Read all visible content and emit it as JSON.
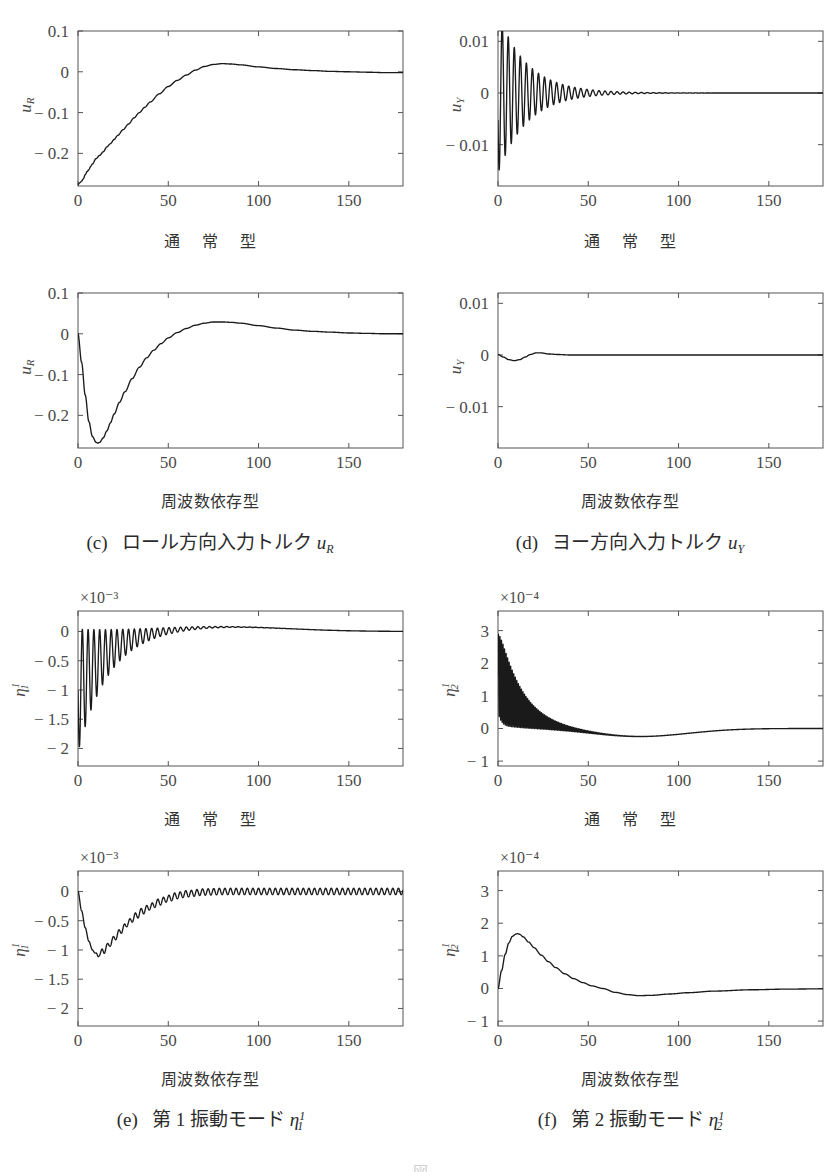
{
  "figure": {
    "bottom_caption": "図",
    "background": "#ffffff",
    "curve_color": "#1a1a1a",
    "axis_color": "#555555"
  },
  "panels": [
    {
      "id": "panel-c-top",
      "row_label": "通 常 型",
      "ylabel_main": "u",
      "ylabel_sub": "R",
      "ylabel_sup": "",
      "xlabel": "t",
      "multiplier": "",
      "yticks": [
        "0.1",
        "0",
        "-0.1",
        "-0.2"
      ],
      "ytick_values": [
        0.1,
        0,
        -0.1,
        -0.2
      ],
      "xticks": [
        "0",
        "50",
        "100",
        "150"
      ],
      "xtick_values": [
        0,
        50,
        100,
        150
      ]
    },
    {
      "id": "panel-d-top",
      "row_label": "通 常 型",
      "ylabel_main": "u",
      "ylabel_sub": "Y",
      "ylabel_sup": "",
      "xlabel": "t",
      "multiplier": "",
      "yticks": [
        "0.01",
        "0",
        "-0.01"
      ],
      "ytick_values": [
        0.01,
        0,
        -0.01
      ],
      "xticks": [
        "0",
        "50",
        "100",
        "150"
      ],
      "xtick_values": [
        0,
        50,
        100,
        150
      ]
    },
    {
      "id": "panel-c-bottom",
      "row_label": "周波数依存型",
      "ylabel_main": "u",
      "ylabel_sub": "R",
      "ylabel_sup": "",
      "xlabel": "t",
      "multiplier": "",
      "yticks": [
        "0.1",
        "0",
        "-0.1",
        "-0.2"
      ],
      "ytick_values": [
        0.1,
        0,
        -0.1,
        -0.2
      ],
      "xticks": [
        "0",
        "50",
        "100",
        "150"
      ],
      "xtick_values": [
        0,
        50,
        100,
        150
      ]
    },
    {
      "id": "panel-d-bottom",
      "row_label": "周波数依存型",
      "ylabel_main": "u",
      "ylabel_sub": "Y",
      "ylabel_sup": "",
      "xlabel": "t",
      "multiplier": "",
      "yticks": [
        "0.01",
        "0",
        "-0.01"
      ],
      "ytick_values": [
        0.01,
        0,
        -0.01
      ],
      "xticks": [
        "0",
        "50",
        "100",
        "150"
      ],
      "xtick_values": [
        0,
        50,
        100,
        150
      ]
    },
    {
      "id": "panel-e-top",
      "row_label": "通 常 型",
      "ylabel_main": "η",
      "ylabel_sub": "1",
      "ylabel_sup": "1",
      "xlabel": "t",
      "multiplier": "×10⁻³",
      "yticks": [
        "0",
        "-0.5",
        "-1",
        "-1.5",
        "-2"
      ],
      "ytick_values": [
        0,
        -0.5,
        -1,
        -1.5,
        -2
      ],
      "xticks": [
        "0",
        "50",
        "100",
        "150"
      ],
      "xtick_values": [
        0,
        50,
        100,
        150
      ]
    },
    {
      "id": "panel-f-top",
      "row_label": "通 常 型",
      "ylabel_main": "η",
      "ylabel_sub": "2",
      "ylabel_sup": "1",
      "xlabel": "t",
      "multiplier": "×10⁻⁴",
      "yticks": [
        "3",
        "2",
        "1",
        "0",
        "-1"
      ],
      "ytick_values": [
        3,
        2,
        1,
        0,
        -1
      ],
      "xticks": [
        "0",
        "50",
        "100",
        "150"
      ],
      "xtick_values": [
        0,
        50,
        100,
        150
      ]
    },
    {
      "id": "panel-e-bottom",
      "row_label": "周波数依存型",
      "ylabel_main": "η",
      "ylabel_sub": "1",
      "ylabel_sup": "1",
      "xlabel": "t",
      "multiplier": "×10⁻³",
      "yticks": [
        "0",
        "-0.5",
        "-1",
        "-1.5",
        "-2"
      ],
      "ytick_values": [
        0,
        -0.5,
        -1,
        -1.5,
        -2
      ],
      "xticks": [
        "0",
        "50",
        "100",
        "150"
      ],
      "xtick_values": [
        0,
        50,
        100,
        150
      ]
    },
    {
      "id": "panel-f-bottom",
      "row_label": "周波数依存型",
      "ylabel_main": "η",
      "ylabel_sub": "2",
      "ylabel_sup": "1",
      "xlabel": "t",
      "multiplier": "×10⁻⁴",
      "yticks": [
        "3",
        "2",
        "1",
        "0",
        "-1"
      ],
      "ytick_values": [
        3,
        2,
        1,
        0,
        -1
      ],
      "xticks": [
        "0",
        "50",
        "100",
        "150"
      ],
      "xtick_values": [
        0,
        50,
        100,
        150
      ]
    }
  ],
  "captions": [
    {
      "id": "caption-c",
      "tag": "(c)",
      "text": "ロール方向入力トルク",
      "sym": "u",
      "sub": "R",
      "sup": ""
    },
    {
      "id": "caption-d",
      "tag": "(d)",
      "text": "ヨー方向入力トルク",
      "sym": "u",
      "sub": "Y",
      "sup": ""
    },
    {
      "id": "caption-e",
      "tag": "(e)",
      "text": "第 1 振動モード",
      "sym": "η",
      "sub": "1",
      "sup": "1"
    },
    {
      "id": "caption-f",
      "tag": "(f)",
      "text": "第 2 振動モード",
      "sym": "η",
      "sub": "2",
      "sup": "1"
    }
  ],
  "chart_data": [
    {
      "id": "panel-c-top",
      "type": "line",
      "title": "ロール方向入力トルク u_R — 通常型",
      "xlabel": "t",
      "ylabel": "u_R",
      "xlim": [
        0,
        180
      ],
      "ylim": [
        -0.28,
        0.1
      ],
      "grid": false,
      "legend": null,
      "multiplier": 1,
      "notes": "rises from -0.275 at t=0 with small ripples, overshoot peak +0.02 near t=77, settles to 0",
      "x": [
        0,
        1,
        2,
        3,
        4,
        5,
        6,
        7,
        8,
        10,
        12,
        14,
        16,
        18,
        20,
        22,
        25,
        28,
        31,
        34,
        37,
        40,
        45,
        50,
        55,
        60,
        65,
        70,
        75,
        80,
        85,
        90,
        100,
        110,
        120,
        130,
        140,
        150,
        160,
        170,
        180
      ],
      "y": [
        -0.276,
        -0.272,
        -0.268,
        -0.262,
        -0.252,
        -0.245,
        -0.24,
        -0.232,
        -0.226,
        -0.213,
        -0.205,
        -0.196,
        -0.184,
        -0.176,
        -0.166,
        -0.156,
        -0.142,
        -0.128,
        -0.113,
        -0.1,
        -0.087,
        -0.074,
        -0.054,
        -0.036,
        -0.021,
        -0.008,
        0.004,
        0.013,
        0.018,
        0.02,
        0.019,
        0.017,
        0.012,
        0.008,
        0.005,
        0.003,
        0.001,
        0.0,
        -0.001,
        -0.002,
        -0.002
      ]
    },
    {
      "id": "panel-d-top",
      "type": "line",
      "title": "ヨー方向入力トルク u_Y — 通常型",
      "xlabel": "t",
      "ylabel": "u_Y",
      "xlim": [
        0,
        180
      ],
      "ylim": [
        -0.018,
        0.012
      ],
      "grid": false,
      "legend": null,
      "multiplier": 1,
      "notes": "damped oscillation, initial spike to -0.017 at t~0.5, first positive peak +0.0105 at t~3, envelope decays to ~0 by t=90, period ~3.3",
      "envelope": {
        "t0": 0,
        "A0": 0.0155,
        "decay_tau": 16,
        "period": 3.35,
        "phase_deg": 200
      }
    },
    {
      "id": "panel-c-bottom",
      "type": "line",
      "title": "ロール方向入力トルク u_R — 周波数依存型",
      "xlabel": "t",
      "ylabel": "u_R",
      "xlim": [
        0,
        180
      ],
      "ylim": [
        -0.28,
        0.1
      ],
      "grid": false,
      "legend": null,
      "multiplier": 1,
      "notes": "smooth: starts 0, dips to -0.268 at t=11, rises, peak +0.029 at t=78, settles to ~0",
      "x": [
        0,
        2,
        4,
        6,
        8,
        10,
        11,
        12,
        14,
        16,
        18,
        20,
        23,
        26,
        30,
        34,
        38,
        42,
        46,
        50,
        55,
        60,
        65,
        70,
        75,
        80,
        85,
        90,
        100,
        110,
        120,
        130,
        140,
        150,
        160,
        170,
        180
      ],
      "y": [
        0.0,
        -0.07,
        -0.15,
        -0.215,
        -0.252,
        -0.266,
        -0.268,
        -0.266,
        -0.255,
        -0.238,
        -0.218,
        -0.197,
        -0.168,
        -0.142,
        -0.11,
        -0.082,
        -0.059,
        -0.04,
        -0.024,
        -0.01,
        0.003,
        0.013,
        0.021,
        0.026,
        0.029,
        0.029,
        0.028,
        0.026,
        0.02,
        0.014,
        0.009,
        0.006,
        0.004,
        0.002,
        0.001,
        0.0,
        0.0
      ]
    },
    {
      "id": "panel-d-bottom",
      "type": "line",
      "title": "ヨー方向入力トルク u_Y — 周波数依存型",
      "xlabel": "t",
      "ylabel": "u_Y",
      "xlim": [
        0,
        180
      ],
      "ylim": [
        -0.018,
        0.012
      ],
      "grid": false,
      "legend": null,
      "multiplier": 1,
      "notes": "nearly flat at 0; small dip to -0.0011 at t~9, small bump +0.0004 at t~22, then flat",
      "x": [
        0,
        3,
        6,
        9,
        12,
        15,
        18,
        21,
        24,
        28,
        33,
        40,
        50,
        60,
        80,
        100,
        120,
        150,
        180
      ],
      "y": [
        0.0001,
        -0.0004,
        -0.0009,
        -0.0011,
        -0.0009,
        -0.0004,
        0.0001,
        0.0004,
        0.0004,
        0.0002,
        0.0001,
        0.0,
        0.0,
        0.0,
        0.0,
        0.0,
        0.0,
        0.0,
        0.0
      ]
    },
    {
      "id": "panel-e-top",
      "type": "line",
      "title": "第1振動モード η₁¹ — 通常型 (×10⁻³)",
      "xlabel": "t",
      "ylabel": "η_1^1",
      "xlim": [
        0,
        180
      ],
      "ylim": [
        -2.3,
        0.35
      ],
      "grid": false,
      "legend": null,
      "multiplier": 0.001,
      "notes": "oscillation between 0 and -2.05 early (t~2), envelope decays to 0 by t~70, slight positive bulge +0.08 near t=75",
      "envelope": {
        "t0": 0,
        "A0": 1.05,
        "offset0": -1.02,
        "decay_tau": 17,
        "period": 3.2,
        "final": 0.0
      }
    },
    {
      "id": "panel-f-top",
      "type": "line",
      "title": "第2振動モード η₂¹ — 通常型 (×10⁻⁴)",
      "xlabel": "t",
      "ylabel": "η_2^1",
      "xlim": [
        0,
        180
      ],
      "ylim": [
        -1.15,
        3.6
      ],
      "grid": false,
      "legend": null,
      "multiplier": 0.0001,
      "notes": "dense high-frequency oscillation, max ~3.2 at t~1, envelope around a mean that decays from 1.7 to 0; dips to -0.25 near t=78 then returns to 0",
      "envelope": {
        "t0": 0,
        "A0": 1.6,
        "mean0": 1.7,
        "decay_tau": 13,
        "period": 0.85,
        "undershoot": -0.25,
        "undershoot_t": 78
      }
    },
    {
      "id": "panel-e-bottom",
      "type": "line",
      "title": "第1振動モード η₁¹ — 周波数依存型 (×10⁻³)",
      "xlabel": "t",
      "ylabel": "η_1^1",
      "xlim": [
        0,
        180
      ],
      "ylim": [
        -2.3,
        0.35
      ],
      "grid": false,
      "legend": null,
      "multiplier": 0.001,
      "notes": "starts 0, dips to -1.1 at t~11, rises back with small ripples amplitude ~0.05 persisting to t=180, settles near 0",
      "x": [
        0,
        2,
        4,
        6,
        8,
        10,
        11,
        12,
        14,
        16,
        18,
        21,
        24,
        28,
        32,
        36,
        40,
        45,
        50,
        55,
        60,
        70,
        80,
        100,
        120,
        150,
        180
      ],
      "y": [
        0.0,
        -0.33,
        -0.62,
        -0.85,
        -1.0,
        -1.07,
        -1.1,
        -1.06,
        -1.02,
        -0.95,
        -0.88,
        -0.77,
        -0.66,
        -0.53,
        -0.42,
        -0.33,
        -0.26,
        -0.18,
        -0.12,
        -0.07,
        -0.04,
        -0.01,
        0.0,
        0.0,
        0.0,
        0.0,
        0.0
      ],
      "ripple": {
        "amp": 0.055,
        "period": 3.1,
        "start_t": 8
      }
    },
    {
      "id": "panel-f-bottom",
      "type": "line",
      "title": "第2振動モード η₂¹ — 周波数依存型 (×10⁻⁴)",
      "xlabel": "t",
      "ylabel": "η_2^1",
      "xlim": [
        0,
        180
      ],
      "ylim": [
        -1.15,
        3.6
      ],
      "grid": false,
      "legend": null,
      "multiplier": 0.0001,
      "notes": "smooth: starts 0, peak 1.68 at t~11, decays, small undershoot -0.22 near t=78, returns to 0",
      "x": [
        0,
        2,
        4,
        6,
        8,
        10,
        11,
        12,
        14,
        17,
        20,
        24,
        28,
        32,
        37,
        42,
        47,
        52,
        58,
        65,
        72,
        78,
        85,
        95,
        105,
        120,
        140,
        160,
        180
      ],
      "y": [
        0.0,
        0.55,
        1.05,
        1.4,
        1.6,
        1.67,
        1.68,
        1.66,
        1.58,
        1.42,
        1.25,
        1.02,
        0.82,
        0.64,
        0.45,
        0.3,
        0.18,
        0.08,
        0.0,
        -0.12,
        -0.19,
        -0.22,
        -0.21,
        -0.17,
        -0.13,
        -0.08,
        -0.04,
        -0.02,
        -0.01
      ]
    }
  ]
}
